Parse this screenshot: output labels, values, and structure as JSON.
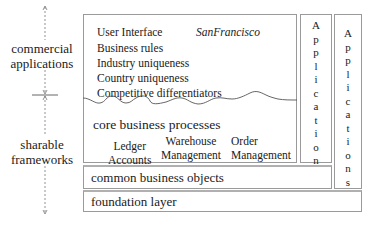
{
  "left_axis": {
    "upper_label_line1": "commercial",
    "upper_label_line2": "applications",
    "lower_label_line1": "sharable",
    "lower_label_line2": "frameworks"
  },
  "main_box": {
    "items": [
      "User Interface",
      "Business rules",
      "Industry uniqueness",
      "Country uniqueness",
      "Competitive differentiators"
    ],
    "project_name": "SanFrancisco",
    "core_title": "core business processes",
    "processes": [
      {
        "line1": "Ledger",
        "line2": "Accounts"
      },
      {
        "line1": "Warehouse",
        "line2": "Management"
      },
      {
        "line1": "Order",
        "line2": "Management"
      }
    ]
  },
  "applications_column_1": {
    "label": "Applications",
    "letters": [
      "A",
      "p",
      "p",
      "l",
      "i",
      "c",
      "a",
      "t",
      "i",
      "o",
      "n",
      "s"
    ]
  },
  "applications_column_2": {
    "label": "Applications",
    "letters": [
      "A",
      "p",
      "p",
      "l",
      "i",
      "c",
      "a",
      "t",
      "i",
      "o",
      "n",
      "s"
    ]
  },
  "common_layer": {
    "label": "common business objects"
  },
  "foundation_layer": {
    "label": "foundation layer"
  },
  "colors": {
    "border": "#9a9a9a",
    "text": "#1a1a1a",
    "axis": "#666666"
  }
}
